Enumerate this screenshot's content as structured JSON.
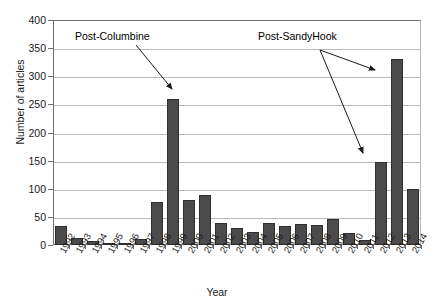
{
  "chart_data": {
    "type": "bar",
    "title": "",
    "xlabel": "Year",
    "ylabel": "Number of articles",
    "ylim": [
      0,
      400
    ],
    "ytick_step": 50,
    "yticks": [
      0,
      50,
      100,
      150,
      200,
      250,
      300,
      350,
      400
    ],
    "grid": true,
    "legend": "none",
    "bar_color": "#4b4b4b",
    "bar_edge_color": "#2e2e2e",
    "categories": [
      "1992",
      "1993",
      "1994",
      "1995",
      "1996",
      "1997",
      "1998",
      "1999",
      "2000",
      "2001",
      "2002",
      "2003",
      "2004",
      "2005",
      "2006",
      "2007",
      "2008",
      "2009",
      "2010",
      "2011",
      "2012",
      "2013",
      "2014"
    ],
    "values": [
      33,
      13,
      7,
      1,
      1,
      11,
      76,
      259,
      80,
      89,
      40,
      30,
      24,
      39,
      33,
      37,
      36,
      47,
      22,
      9,
      147,
      330,
      100
    ],
    "annotations": [
      {
        "text": "Post-Columbine",
        "label_x": 75,
        "label_y": 31,
        "arrows": [
          {
            "from_x": 136,
            "from_y": 45,
            "to_x": 172,
            "to_y": 89
          }
        ]
      },
      {
        "text": "Post-SandyHook",
        "label_x": 258,
        "label_y": 31,
        "arrows": [
          {
            "from_x": 320,
            "from_y": 50,
            "to_x": 375,
            "to_y": 70
          },
          {
            "from_x": 320,
            "from_y": 50,
            "to_x": 363,
            "to_y": 153
          }
        ]
      }
    ]
  }
}
